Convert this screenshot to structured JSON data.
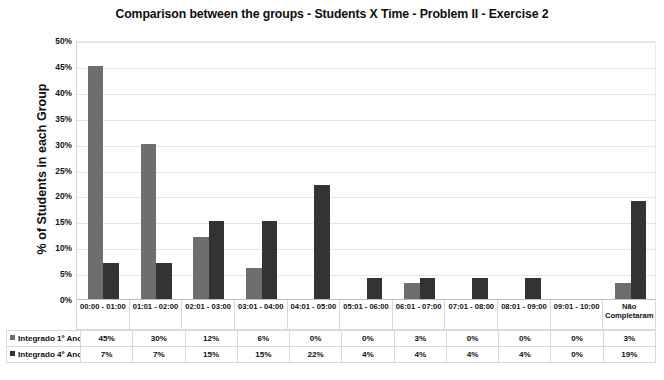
{
  "chart_data": {
    "type": "bar",
    "title": "Comparison between the groups - Students X Time - Problem II - Exercise 2",
    "xlabel": "",
    "ylabel": "% of Students in each Group",
    "ylim": [
      0,
      50
    ],
    "ytick_labels": [
      "50%",
      "45%",
      "40%",
      "35%",
      "30%",
      "25%",
      "20%",
      "15%",
      "10%",
      "5%",
      "0%"
    ],
    "ytick_values": [
      50,
      45,
      40,
      35,
      30,
      25,
      20,
      15,
      10,
      5,
      0
    ],
    "grid": true,
    "legend_position": "data-table-below",
    "categories": [
      "00:00 - 01:00",
      "01:01 - 02:00",
      "02:01 - 03:00",
      "03:01 - 04:00",
      "04:01 - 05:00",
      "05:01 - 06:00",
      "06:01 - 07:00",
      "07:01 - 08:00",
      "08:01 - 09:00",
      "09:01 - 10:00",
      "Não Completaram"
    ],
    "series": [
      {
        "name": "Integrado 1º Ano",
        "color": "#6e6e6e",
        "values": [
          45,
          30,
          12,
          6,
          0,
          0,
          3,
          0,
          0,
          0,
          3
        ],
        "labels": [
          "45%",
          "30%",
          "12%",
          "6%",
          "0%",
          "0%",
          "3%",
          "0%",
          "0%",
          "0%",
          "3%"
        ]
      },
      {
        "name": "Integrado 4º Ano",
        "color": "#333333",
        "values": [
          7,
          7,
          15,
          15,
          22,
          4,
          4,
          4,
          4,
          0,
          19
        ],
        "labels": [
          "7%",
          "7%",
          "15%",
          "15%",
          "22%",
          "4%",
          "4%",
          "4%",
          "4%",
          "0%",
          "19%"
        ]
      }
    ]
  }
}
